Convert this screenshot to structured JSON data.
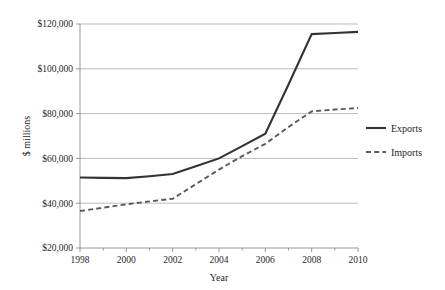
{
  "chart_data": {
    "type": "line",
    "title": "",
    "xlabel": "Year",
    "ylabel": "$ millions",
    "x": [
      1998,
      1999,
      2000,
      2001,
      2002,
      2003,
      2004,
      2005,
      2006,
      2007,
      2008,
      2009,
      2010
    ],
    "xlim": [
      1998,
      2010
    ],
    "ylim": [
      20000,
      120000
    ],
    "xticks": [
      1998,
      2000,
      2002,
      2004,
      2006,
      2008,
      2010
    ],
    "xtick_labels": [
      "1998",
      "2000",
      "2002",
      "2004",
      "2006",
      "2008",
      "2010"
    ],
    "xminor_ticks": [
      1999,
      2001,
      2003,
      2005,
      2007,
      2009
    ],
    "yticks": [
      20000,
      40000,
      60000,
      80000,
      100000,
      120000
    ],
    "ytick_labels": [
      "$20,000",
      "$40,000",
      "$60,000",
      "$80,000",
      "$100,000",
      "$120,000"
    ],
    "grid": "horizontal",
    "legend_position": "right",
    "series": [
      {
        "name": "Exports",
        "style": "solid",
        "color": "#333333",
        "width": 2.1,
        "values": [
          51500,
          51300,
          51200,
          52000,
          53000,
          56500,
          60000,
          65500,
          71000,
          93000,
          115500,
          116000,
          116500
        ]
      },
      {
        "name": "Imports",
        "style": "dashed",
        "color": "#5a5a5a",
        "width": 1.9,
        "values": [
          36500,
          38000,
          39500,
          40800,
          42000,
          48500,
          55000,
          61000,
          66500,
          74000,
          81000,
          81800,
          82500
        ]
      }
    ]
  },
  "axes": {
    "y_title": "$ millions",
    "x_title": "Year"
  },
  "legend": {
    "items": [
      {
        "label": "Exports",
        "style": "solid"
      },
      {
        "label": "Imports",
        "style": "dashed"
      }
    ]
  },
  "colors": {
    "exports": "#333333",
    "imports": "#5a5a5a",
    "grid": "#a9a9a9",
    "axis": "#8c8c8c",
    "background": "#ffffff",
    "text": "#1f1f1f"
  }
}
